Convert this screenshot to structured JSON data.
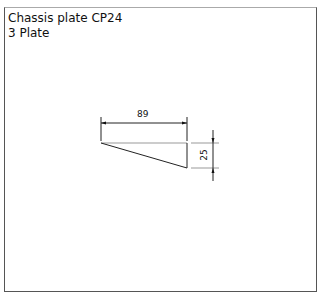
{
  "header": {
    "line1": "Chassis plate CP24",
    "line2": "3 Plate"
  },
  "drawing": {
    "shape": "right-triangle",
    "dimensions": {
      "width_label": "89",
      "height_label": "25"
    }
  }
}
